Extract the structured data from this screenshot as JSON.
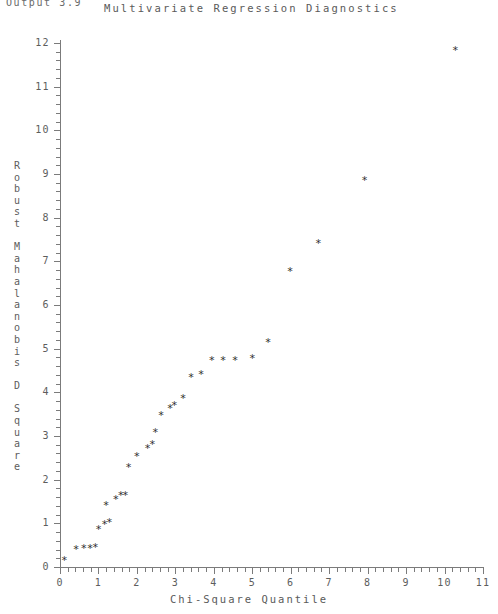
{
  "header": {
    "output_id": "Output 3.9",
    "title": "Multivariate Regression Diagnostics"
  },
  "chart_data": {
    "type": "scatter",
    "title": "Multivariate Regression Diagnostics",
    "xlabel": "Chi-Square Quantile",
    "ylabel": "Robust Mahalanobis D Square",
    "ylabel_vertical_chars": "R\no\nb\nu\ns\nt\n\nM\na\nh\na\nl\na\nn\no\nb\ni\ns\n\nD\n\nS\nq\nu\na\nr\ne",
    "xlim": [
      0,
      11
    ],
    "ylim": [
      0,
      12
    ],
    "xticks": [
      0,
      1,
      2,
      3,
      4,
      5,
      6,
      7,
      8,
      9,
      10,
      11
    ],
    "yticks": [
      0,
      1,
      2,
      3,
      4,
      5,
      6,
      7,
      8,
      9,
      10,
      11,
      12
    ],
    "xtick_labels": [
      "0",
      "1",
      "2",
      "3",
      "4",
      "5",
      "6",
      "7",
      "8",
      "9",
      "10",
      "11"
    ],
    "ytick_labels": [
      "0",
      "1",
      "2",
      "3",
      "4",
      "5",
      "6",
      "7",
      "8",
      "9",
      "10",
      "11",
      "12"
    ],
    "x_minor_ticks_per_interval": 4,
    "y_minor_ticks_per_interval": 4,
    "grid": false,
    "legend": false,
    "marker": "*",
    "marker_color": "#2f2f2f",
    "axis_color": "#7b7b7b",
    "background": "#ffffff",
    "n_points": 28,
    "points": [
      {
        "x": 0.11,
        "y": 0.23
      },
      {
        "x": 0.42,
        "y": 0.48
      },
      {
        "x": 0.62,
        "y": 0.5
      },
      {
        "x": 0.78,
        "y": 0.5
      },
      {
        "x": 0.92,
        "y": 0.52
      },
      {
        "x": 1.0,
        "y": 0.95
      },
      {
        "x": 1.16,
        "y": 1.05
      },
      {
        "x": 1.28,
        "y": 1.1
      },
      {
        "x": 1.2,
        "y": 1.48
      },
      {
        "x": 1.45,
        "y": 1.62
      },
      {
        "x": 1.58,
        "y": 1.72
      },
      {
        "x": 1.7,
        "y": 1.72
      },
      {
        "x": 1.78,
        "y": 2.35
      },
      {
        "x": 2.0,
        "y": 2.62
      },
      {
        "x": 2.28,
        "y": 2.8
      },
      {
        "x": 2.4,
        "y": 2.88
      },
      {
        "x": 2.48,
        "y": 3.15
      },
      {
        "x": 2.63,
        "y": 3.55
      },
      {
        "x": 2.86,
        "y": 3.7
      },
      {
        "x": 2.97,
        "y": 3.78
      },
      {
        "x": 3.2,
        "y": 3.95
      },
      {
        "x": 3.41,
        "y": 4.42
      },
      {
        "x": 3.67,
        "y": 4.48
      },
      {
        "x": 3.95,
        "y": 4.82
      },
      {
        "x": 4.24,
        "y": 4.82
      },
      {
        "x": 4.55,
        "y": 4.82
      },
      {
        "x": 5.0,
        "y": 4.85
      },
      {
        "x": 5.41,
        "y": 5.22
      },
      {
        "x": 5.98,
        "y": 6.85
      },
      {
        "x": 6.72,
        "y": 7.48
      },
      {
        "x": 7.92,
        "y": 8.92
      },
      {
        "x": 10.28,
        "y": 11.9
      }
    ]
  }
}
